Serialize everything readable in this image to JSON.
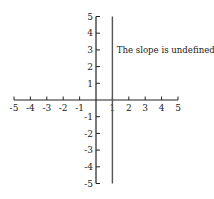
{
  "chart_data": {
    "type": "line",
    "title": "",
    "xlabel": "",
    "ylabel": "",
    "xlim": [
      -5,
      5
    ],
    "ylim": [
      -5,
      5
    ],
    "grid": false,
    "x_ticks": [
      -5,
      -4,
      -3,
      -2,
      -1,
      1,
      2,
      3,
      4,
      5
    ],
    "y_ticks": [
      5,
      4,
      3,
      2,
      1,
      -1,
      -2,
      -3,
      -4,
      -5
    ],
    "series": [
      {
        "name": "vertical line x = 1",
        "x": [
          1,
          1
        ],
        "y": [
          -5,
          5
        ]
      }
    ],
    "annotations": [
      {
        "text": "The slope is undefined.",
        "x": 1.2,
        "y": 3
      }
    ]
  },
  "colors": {
    "axis": "#222222",
    "line": "#555555",
    "text": "#222222",
    "background": "#ffffff"
  }
}
